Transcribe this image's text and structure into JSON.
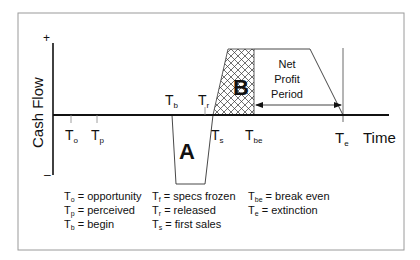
{
  "diagram": {
    "y_axis": {
      "label": "Cash Flow",
      "plus": "+",
      "minus": "–"
    },
    "x_axis": {
      "label": "Time"
    },
    "regions": {
      "a": {
        "label": "A",
        "meaning": "investment (negative cash flow)"
      },
      "b": {
        "label": "B",
        "meaning": "payback"
      },
      "net_profit": {
        "line1": "Net",
        "line2": "Profit",
        "line3": "Period"
      }
    },
    "time_markers": [
      {
        "main": "T",
        "sub": "o"
      },
      {
        "main": "T",
        "sub": "p"
      },
      {
        "main": "T",
        "sub": "b"
      },
      {
        "main": "T",
        "sub": "r"
      },
      {
        "main": "T",
        "sub": "s"
      },
      {
        "main": "T",
        "sub": "be"
      },
      {
        "main": "T",
        "sub": "e"
      }
    ],
    "legend": [
      {
        "main": "T",
        "sub": "o",
        "text": " = opportunity"
      },
      {
        "main": "T",
        "sub": "p",
        "text": " = perceived"
      },
      {
        "main": "T",
        "sub": "b",
        "text": " = begin"
      },
      {
        "main": "T",
        "sub": "f",
        "text": " = specs frozen"
      },
      {
        "main": "T",
        "sub": "r",
        "text": " = released"
      },
      {
        "main": "T",
        "sub": "s",
        "text": " = first sales"
      },
      {
        "main": "T",
        "sub": "be",
        "text": " = break even"
      },
      {
        "main": "T",
        "sub": "e",
        "text": " = extinction"
      }
    ]
  }
}
